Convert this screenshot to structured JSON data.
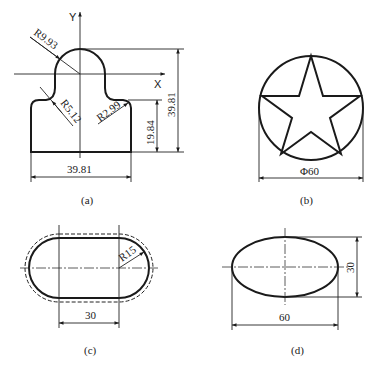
{
  "figures": {
    "a": {
      "caption": "(a)",
      "axis_x_label": "X",
      "axis_y_label": "Y",
      "dims": {
        "radius_head": "R9.93",
        "radius_neck": "R5.12",
        "radius_shoulder": "R2.99",
        "width": "39.81",
        "shoulder_height": "19.84",
        "total_height": "39.81"
      }
    },
    "b": {
      "caption": "(b)",
      "dims": {
        "diameter": "Φ60"
      }
    },
    "c": {
      "caption": "(c)",
      "dims": {
        "radius": "R15",
        "center_distance": "30"
      }
    },
    "d": {
      "caption": "(d)",
      "dims": {
        "major_axis": "60",
        "minor_axis": "30"
      }
    }
  },
  "colors": {
    "line": "#1a1a1a",
    "background": "#ffffff"
  }
}
